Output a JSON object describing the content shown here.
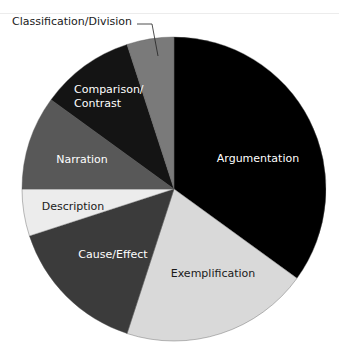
{
  "chart_data": {
    "type": "pie",
    "title": "",
    "start_angle_deg": 0,
    "direction": "clockwise",
    "categories": [
      "Argumentation",
      "Exemplification",
      "Cause/Effect",
      "Description",
      "Narration",
      "Comparison/Contrast",
      "Classification/Division"
    ],
    "values": [
      35,
      20,
      15,
      5,
      10,
      10,
      5
    ],
    "colors": [
      "#000000",
      "#d9d9d9",
      "#3b3b3b",
      "#ececec",
      "#585858",
      "#141414",
      "#7a7a7a"
    ],
    "label_colors": [
      "#ffffff",
      "#1a1a1a",
      "#ffffff",
      "#1a1a1a",
      "#ffffff",
      "#ffffff",
      "#1a1a1a"
    ],
    "labels": [
      {
        "text": "Argumentation",
        "x": 258,
        "y": 162
      },
      {
        "text": "Exemplification",
        "x": 213,
        "y": 277
      },
      {
        "text": "Cause/Effect",
        "x": 113,
        "y": 258
      },
      {
        "text": "Description",
        "x": 73,
        "y": 210
      },
      {
        "text": "Narration",
        "x": 82,
        "y": 163
      },
      {
        "text": "Comparison/\nContrast",
        "x": 74,
        "y": 93
      },
      {
        "text": "Classification/Division",
        "x": 12,
        "y": 25,
        "callout": true
      }
    ],
    "legend": "none (labels on slices; Classification/Division uses external callout line)"
  }
}
